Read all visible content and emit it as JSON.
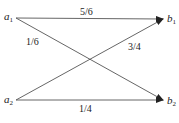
{
  "diagram": {
    "type": "bipartite-transition",
    "inputs": [
      {
        "id": "a1",
        "base": "a",
        "sub": "1"
      },
      {
        "id": "a2",
        "base": "a",
        "sub": "2"
      }
    ],
    "outputs": [
      {
        "id": "b1",
        "base": "b",
        "sub": "1"
      },
      {
        "id": "b2",
        "base": "b",
        "sub": "2"
      }
    ],
    "edges": [
      {
        "from": "a1",
        "to": "b1",
        "label": "5/6"
      },
      {
        "from": "a1",
        "to": "b2",
        "label": "1/6"
      },
      {
        "from": "a2",
        "to": "b1",
        "label": "3/4"
      },
      {
        "from": "a2",
        "to": "b2",
        "label": "1/4"
      }
    ],
    "colors": {
      "line": "#444444",
      "text": "#222222"
    }
  }
}
